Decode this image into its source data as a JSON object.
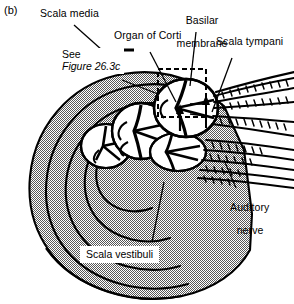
{
  "figure": {
    "panel_tag": "(b)",
    "background_color": "#ffffff",
    "ink_color": "#000000",
    "stipple_color": "#8a8a8a"
  },
  "labels": {
    "scala_media": "Scala media",
    "organ_of_corti": "Organ of Corti",
    "basilar_membrane_line1": "Basilar",
    "basilar_membrane_line2": "membrane",
    "scala_tympani": "Scala tympani",
    "auditory_nerve_line1": "Auditory",
    "auditory_nerve_line2": "nerve",
    "scala_vestibuli": "Scala vestibuli"
  },
  "callout": {
    "line1": "See",
    "line2": "Figure 26.3c"
  }
}
